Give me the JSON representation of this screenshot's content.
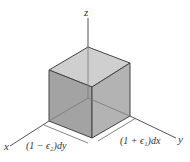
{
  "diagram": {
    "axes": {
      "z_label": "z",
      "x_label": "x",
      "y_label": "y"
    },
    "dimensions": {
      "left_label": "(1 − ϵ₂)dy",
      "right_label": "(1 + ϵ₁)dx"
    },
    "colors": {
      "cube_top": "#c4c4c4",
      "cube_left": "#9e9e9e",
      "cube_right": "#aaaaaa",
      "edge": "#444444",
      "axis": "#555555"
    }
  }
}
